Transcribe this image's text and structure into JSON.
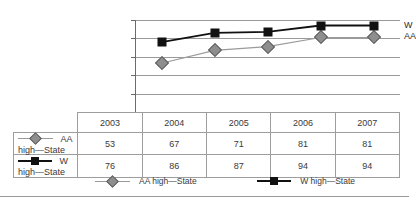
{
  "chart_data": {
    "type": "line",
    "title": "",
    "xlabel": "",
    "ylabel": "",
    "ylim": [
      0,
      100
    ],
    "grid": true,
    "legend_position": "bottom",
    "categories": [
      "2003",
      "2004",
      "2005",
      "2006",
      "2007"
    ],
    "yticks": [
      "100",
      "80",
      "60",
      "40",
      "20",
      "0"
    ],
    "series": [
      {
        "name": "AA high—State",
        "values": [
          53,
          67,
          71,
          81,
          81
        ],
        "marker": "diamond",
        "color": "#8e8e8e",
        "end_annotation": "AA"
      },
      {
        "name": "W high—State",
        "values": [
          76,
          86,
          87,
          94,
          94
        ],
        "marker": "square",
        "color": "#111111",
        "end_annotation": "W"
      }
    ],
    "annotations": [
      "W",
      "AA"
    ]
  },
  "table": {
    "corner_label": "",
    "headers": [
      "",
      "2003",
      "2004",
      "2005",
      "2006",
      "2007"
    ],
    "rows": [
      {
        "label": "AA high—State",
        "values": [
          "53",
          "67",
          "71",
          "81",
          "81"
        ]
      },
      {
        "label": "W high—State",
        "values": [
          "76",
          "86",
          "87",
          "94",
          "94"
        ]
      }
    ]
  },
  "legend": {
    "items": [
      {
        "label": "AA high—State"
      },
      {
        "label": "W high—State"
      }
    ]
  }
}
